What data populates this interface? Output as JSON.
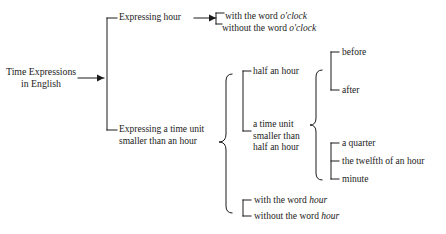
{
  "diagram": {
    "type": "tree-diagram",
    "title": "Time Expressions in English",
    "background_color": "#ffffff",
    "line_color": "#1a1a1a",
    "text_color": "#1a1a1a",
    "root": {
      "label_line1": "Time Expressions",
      "label_line2": "in English"
    },
    "branches": {
      "expressing_hour": {
        "label": "Expressing hour",
        "children": [
          {
            "prefix": "with the word ",
            "emphasis": "o'clock"
          },
          {
            "prefix": "without the word ",
            "emphasis": "o'clock"
          }
        ]
      },
      "smaller_than_hour": {
        "label_line1": "Expressing a time unit",
        "label_line2": "smaller than an hour",
        "groups": {
          "units": [
            {
              "label_line1": "half an hour",
              "label_line2": "",
              "label_line3": ""
            },
            {
              "label_line1": "a time unit",
              "label_line2": "smaller than",
              "label_line3": "half an hour"
            }
          ],
          "half_an_hour_modifiers": [
            "before",
            "after"
          ],
          "smaller_unit_items": [
            "a quarter",
            "the twelfth of an hour",
            "minute"
          ],
          "hour_word_options": [
            {
              "prefix": "with the word ",
              "emphasis": "hour"
            },
            {
              "prefix": "without the word ",
              "emphasis": "hour"
            }
          ]
        }
      }
    }
  }
}
